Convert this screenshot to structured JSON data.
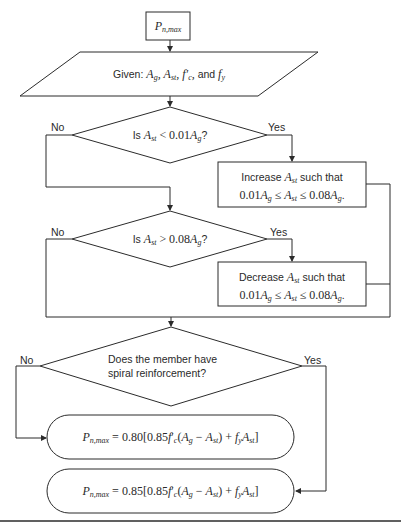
{
  "diagram": {
    "type": "flowchart",
    "colors": {
      "stroke": "#2b2b2b",
      "text": "#2a2a2a",
      "background": "#ffffff"
    },
    "start": {
      "shape": "rectangle",
      "symbol": "P",
      "subscript": "n,max"
    },
    "input": {
      "shape": "parallelogram",
      "prefix": "Given:",
      "vars": [
        "A",
        "g",
        "A",
        "st",
        "f",
        "c",
        "f",
        "y"
      ],
      "text": "Given: A_g, A_st, f'_c, and f_y",
      "and_label": "and"
    },
    "decisions": [
      {
        "id": "check-min",
        "prefix": "Is",
        "var": "A",
        "var_sub": "st",
        "op": "<",
        "rhs": "0.01",
        "rhs_var": "A",
        "rhs_sub": "g",
        "suffix": "?",
        "text": "Is A_st < 0.01A_g?",
        "no_label": "No",
        "yes_label": "Yes"
      },
      {
        "id": "check-max",
        "prefix": "Is",
        "var": "A",
        "var_sub": "st",
        "op": ">",
        "rhs": "0.08",
        "rhs_var": "A",
        "rhs_sub": "g",
        "suffix": "?",
        "text": "Is A_st > 0.08A_g?",
        "no_label": "No",
        "yes_label": "Yes"
      },
      {
        "id": "check-spiral",
        "line1": "Does the member have",
        "line2": "spiral reinforcement?",
        "no_label": "No",
        "yes_label": "Yes"
      }
    ],
    "processes": [
      {
        "id": "increase",
        "verb": "Increase",
        "tail": "such that",
        "range_low": "0.01",
        "range_high": "0.08",
        "leq": "≤",
        "text": "Increase A_st such that 0.01A_g ≤ A_st ≤ 0.08A_g."
      },
      {
        "id": "decrease",
        "verb": "Decrease",
        "tail": "such that",
        "range_low": "0.01",
        "range_high": "0.08",
        "leq": "≤",
        "text": "Decrease A_st such that 0.01A_g ≤ A_st ≤ 0.08A_g."
      }
    ],
    "terminals": [
      {
        "id": "tied",
        "factor": "0.80",
        "inner": "0.85",
        "text": "P_n,max = 0.80[0.85f'_c(A_g − A_st) + f_y A_st]"
      },
      {
        "id": "spiral",
        "factor": "0.85",
        "inner": "0.85",
        "text": "P_n,max = 0.85[0.85f'_c(A_g − A_st) + f_y A_st]"
      }
    ]
  }
}
